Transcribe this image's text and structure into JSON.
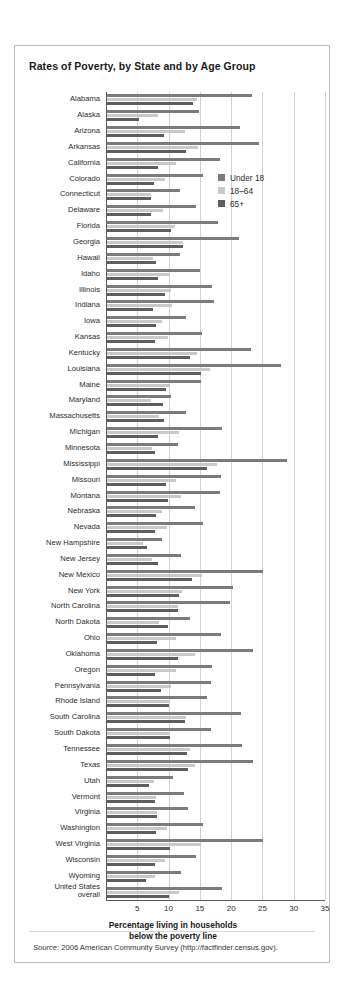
{
  "figure": {
    "title": "Rates of Poverty, by State and by Age Group",
    "source_prefix": "Source:",
    "source_text": " 2006 American Community Survey (http://factfinder.census.gov)."
  },
  "legend": {
    "position": "inside-top-right",
    "items": [
      {
        "label": "Under 18",
        "color": "#7b7b7b"
      },
      {
        "label": "18–64",
        "color": "#c9c9c9"
      },
      {
        "label": "65+",
        "color": "#5e5e5e"
      }
    ]
  },
  "chart_data": {
    "type": "bar",
    "orientation": "horizontal",
    "title": "Rates of Poverty, by State and by Age Group",
    "xlabel": "Percentage living in households below the poverty line",
    "xlabel_line1": "Percentage living in households",
    "xlabel_line2": "below the poverty line",
    "ylabel": "",
    "xlim": [
      0,
      35
    ],
    "xticks": [
      5,
      10,
      15,
      20,
      25,
      30,
      35
    ],
    "grid": "vertical",
    "categories": [
      "Alabama",
      "Alaska",
      "Arizona",
      "Arkansas",
      "California",
      "Colorado",
      "Connecticut",
      "Delaware",
      "Florida",
      "Georgia",
      "Hawaii",
      "Idaho",
      "Illinois",
      "Indiana",
      "Iowa",
      "Kansas",
      "Kentucky",
      "Louisiana",
      "Maine",
      "Maryland",
      "Massachusetts",
      "Michigan",
      "Minnesota",
      "Mississippi",
      "Missouri",
      "Montana",
      "Nebraska",
      "Nevada",
      "New Hampshire",
      "New Jersey",
      "New Mexico",
      "New York",
      "North Carolina",
      "North Dakota",
      "Ohio",
      "Oklahoma",
      "Oregon",
      "Pennsylvania",
      "Rhode Island",
      "South Carolina",
      "South Dakota",
      "Tennessee",
      "Texas",
      "Utah",
      "Vermont",
      "Virginia",
      "Washington",
      "West Virginia",
      "Wisconsin",
      "Wyoming",
      "United States overall"
    ],
    "series": [
      {
        "name": "Under 18",
        "color": "#7b7b7b",
        "values": [
          23.2,
          14.7,
          21.3,
          24.3,
          18.1,
          15.3,
          11.7,
          14.2,
          17.7,
          21.1,
          11.7,
          14.9,
          16.8,
          17.1,
          12.7,
          15.2,
          23.0,
          27.8,
          15.1,
          10.3,
          12.6,
          18.3,
          11.3,
          28.8,
          18.2,
          18.1,
          14.0,
          15.3,
          8.8,
          11.8,
          24.9,
          20.1,
          19.6,
          13.2,
          18.2,
          23.3,
          16.8,
          16.6,
          16.0,
          21.4,
          16.7,
          21.6,
          23.3,
          10.5,
          12.3,
          12.9,
          15.3,
          25.0,
          14.2,
          11.8,
          18.3
        ]
      },
      {
        "name": "18–64",
        "color": "#c9c9c9",
        "values": [
          14.4,
          8.1,
          12.4,
          14.6,
          11.1,
          9.3,
          7.0,
          8.9,
          10.8,
          12.2,
          7.4,
          9.9,
          10.2,
          10.4,
          8.8,
          9.8,
          14.4,
          16.5,
          10.1,
          7.0,
          8.3,
          11.5,
          7.2,
          17.5,
          11.0,
          11.8,
          8.8,
          9.6,
          5.8,
          7.2,
          15.2,
          12.0,
          11.4,
          8.3,
          11.0,
          14.1,
          11.0,
          10.2,
          10.0,
          12.7,
          9.9,
          13.2,
          14.0,
          7.5,
          7.8,
          8.0,
          9.6,
          15.1,
          9.2,
          7.7,
          11.5
        ]
      },
      {
        "name": "65+",
        "color": "#5e5e5e",
        "values": [
          13.8,
          5.1,
          9.1,
          12.6,
          8.1,
          7.5,
          7.1,
          7.0,
          10.2,
          12.1,
          7.9,
          8.2,
          9.3,
          7.4,
          7.8,
          7.6,
          13.3,
          15.1,
          9.4,
          8.9,
          9.1,
          8.2,
          7.7,
          16.0,
          9.4,
          9.8,
          7.9,
          7.6,
          6.4,
          8.1,
          13.6,
          11.5,
          11.4,
          9.8,
          8.0,
          11.4,
          7.6,
          8.7,
          9.9,
          12.4,
          10.0,
          12.8,
          12.9,
          6.7,
          7.6,
          8.0,
          7.9,
          10.1,
          7.6,
          6.3,
          9.9
        ]
      }
    ]
  }
}
